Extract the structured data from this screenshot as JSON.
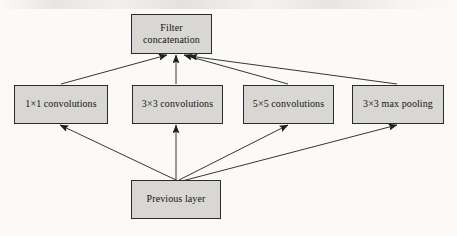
{
  "diagram": {
    "type": "flow-diagram",
    "background_color": "#fbfaf8",
    "node_fill_color": "#d9d7d3",
    "node_border_color": "#2b2b2b",
    "edge_color": "#1f1f1f",
    "nodes": [
      {
        "id": "filter-concatenation",
        "label": "Filter concatenation",
        "label_lines": [
          "Filter",
          "concatenation"
        ],
        "x": 131,
        "y": 14,
        "w": 81,
        "h": 40,
        "role": "output"
      },
      {
        "id": "conv-1x1",
        "label": "1×1 convolutions",
        "x": 14,
        "y": 85,
        "w": 94,
        "h": 39,
        "role": "branch"
      },
      {
        "id": "conv-3x3",
        "label": "3×3 convolutions",
        "x": 132,
        "y": 85,
        "w": 91,
        "h": 39,
        "role": "branch"
      },
      {
        "id": "conv-5x5",
        "label": "5×5 convolutions",
        "x": 243,
        "y": 85,
        "w": 91,
        "h": 39,
        "role": "branch"
      },
      {
        "id": "maxpool-3x3",
        "label": "3×3 max pooling",
        "x": 352,
        "y": 85,
        "w": 92,
        "h": 39,
        "role": "branch"
      },
      {
        "id": "previous-layer",
        "label": "Previous layer",
        "x": 131,
        "y": 180,
        "w": 90,
        "h": 39,
        "role": "input"
      }
    ],
    "edges": [
      {
        "id": "prev-to-conv1x1",
        "from": "previous-layer",
        "to": "conv-1x1",
        "x1": 176,
        "y1": 180,
        "x2": 60,
        "y2": 125
      },
      {
        "id": "prev-to-conv3x3",
        "from": "previous-layer",
        "to": "conv-3x3",
        "x1": 176,
        "y1": 180,
        "x2": 176,
        "y2": 125
      },
      {
        "id": "prev-to-conv5x5",
        "from": "previous-layer",
        "to": "conv-5x5",
        "x1": 179,
        "y1": 180,
        "x2": 288,
        "y2": 125
      },
      {
        "id": "prev-to-maxpool",
        "from": "previous-layer",
        "to": "maxpool-3x3",
        "x1": 182,
        "y1": 181,
        "x2": 397,
        "y2": 125
      },
      {
        "id": "conv1x1-to-concat",
        "from": "conv-1x1",
        "to": "filter-concatenation",
        "x1": 61,
        "y1": 84,
        "x2": 167,
        "y2": 55
      },
      {
        "id": "conv3x3-to-concat",
        "from": "conv-3x3",
        "to": "filter-concatenation",
        "x1": 176,
        "y1": 84,
        "x2": 176,
        "y2": 55
      },
      {
        "id": "conv5x5-to-concat",
        "from": "conv-5x5",
        "to": "filter-concatenation",
        "x1": 288,
        "y1": 84,
        "x2": 184,
        "y2": 55
      },
      {
        "id": "maxpool-to-concat",
        "from": "maxpool-3x3",
        "to": "filter-concatenation",
        "x1": 397,
        "y1": 84,
        "x2": 189,
        "y2": 56
      }
    ]
  }
}
